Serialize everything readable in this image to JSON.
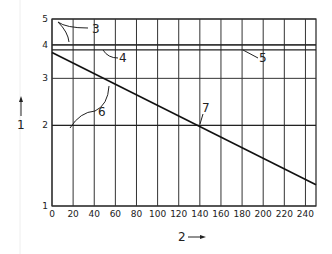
{
  "chart_data": {
    "type": "line",
    "title": "",
    "xlabel": "2",
    "ylabel": "1",
    "xlim": [
      0,
      250
    ],
    "ylim": [
      1,
      5
    ],
    "yscale": "log",
    "grid": true,
    "x_ticks": [
      "0",
      "20",
      "40",
      "60",
      "80",
      "100",
      "120",
      "140",
      "160",
      "180",
      "200",
      "220",
      "240"
    ],
    "y_ticks": [
      "1",
      "2",
      "3",
      "4",
      "5"
    ],
    "series": [
      {
        "name": "line 6",
        "x": [
          0,
          250
        ],
        "y": [
          3.75,
          1.2
        ]
      }
    ],
    "reference_lines": [
      {
        "name": "line 3",
        "y": 4.0
      },
      {
        "name": "line 5",
        "y": 3.83
      },
      {
        "name": "line 7",
        "y": 2.0
      }
    ],
    "annotations": [
      {
        "label": "3",
        "points_to": "y=4 reference line"
      },
      {
        "label": "4",
        "points_to": "y=3.83 reference line"
      },
      {
        "label": "5",
        "points_to": "y=3.83 reference line"
      },
      {
        "label": "6",
        "points_to": "sloped line / y=2 line"
      },
      {
        "label": "7",
        "points_to": "intersection at x=140, y=2"
      }
    ]
  },
  "axes": {
    "x_title": "2",
    "y_title": "1"
  },
  "labels": {
    "a3": "3",
    "a4": "4",
    "a5": "5",
    "a6": "6",
    "a7": "7"
  }
}
